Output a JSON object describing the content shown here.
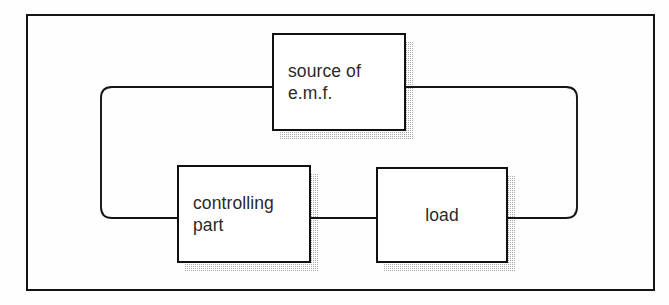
{
  "figure": {
    "type": "block-diagram",
    "title": "",
    "background_color": "#fefefe",
    "line_color": "#141414",
    "shadow_color": "#9a9a9a"
  },
  "frame": {
    "name": "outer-border",
    "x": 26,
    "y": 14,
    "width": 629,
    "height": 277
  },
  "blocks": [
    {
      "id": "source-of-emf",
      "label": "source of\ne.m.f.",
      "line1": "source of",
      "line2": "e.m.f.",
      "x": 272,
      "y": 33,
      "width": 134,
      "height": 98,
      "align": "left",
      "shadow_offset_x": 8,
      "shadow_offset_y": 8
    },
    {
      "id": "controlling-part",
      "label": "controlling\npart",
      "line1": "controlling",
      "line2": "part",
      "x": 177,
      "y": 165,
      "width": 134,
      "height": 98,
      "align": "left",
      "shadow_offset_x": 8,
      "shadow_offset_y": 8
    },
    {
      "id": "load",
      "label": "load",
      "line1": "load",
      "line2": "",
      "x": 376,
      "y": 167,
      "width": 132,
      "height": 96,
      "align": "center",
      "shadow_offset_x": 8,
      "shadow_offset_y": 8
    }
  ],
  "connections": [
    {
      "id": "emf-left-to-controlling-part",
      "from": "source-of-emf",
      "to": "controlling-part",
      "path": "M 272 87 L 112 87 Q 101 87 101 98 L 101 207 Q 101 218 112 218 L 177 218"
    },
    {
      "id": "emf-right-to-load",
      "from": "source-of-emf",
      "to": "load",
      "path": "M 406 87 L 566 87 Q 577 87 577 98 L 577 207 Q 577 218 566 218 L 508 218"
    },
    {
      "id": "controlling-part-to-load",
      "from": "controlling-part",
      "to": "load",
      "path": "M 311 218 L 376 218"
    }
  ],
  "junctions": [
    {
      "id": "emf-left-terminal",
      "x": 272,
      "y": 87
    },
    {
      "id": "emf-right-terminal",
      "x": 406,
      "y": 87
    },
    {
      "id": "controlling-part-left-terminal",
      "x": 177,
      "y": 218
    },
    {
      "id": "controlling-part-right-terminal",
      "x": 311,
      "y": 218
    },
    {
      "id": "load-left-terminal",
      "x": 376,
      "y": 218
    },
    {
      "id": "load-right-terminal",
      "x": 508,
      "y": 218
    }
  ]
}
